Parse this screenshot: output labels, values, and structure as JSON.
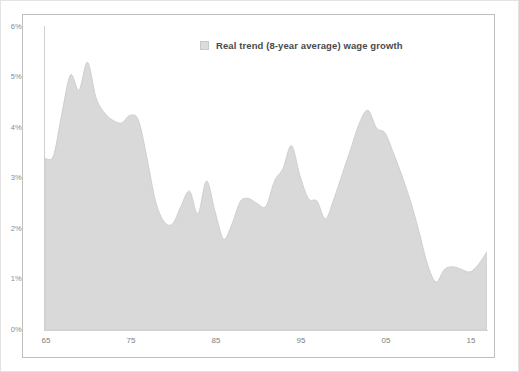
{
  "chart_data": {
    "type": "area",
    "title": "",
    "subtitle": "",
    "xlabel": "",
    "ylabel": "",
    "ylim": [
      0,
      6
    ],
    "xlim": [
      1965,
      2017
    ],
    "grid": false,
    "legend_position": "top-center",
    "y_tick_labels": [
      "6%",
      "5%",
      "4%",
      "3%",
      "2%",
      "1%",
      "0%"
    ],
    "y_tick_values": [
      6,
      5,
      4,
      3,
      2,
      1,
      0
    ],
    "x_tick_labels": [
      "65",
      "75",
      "85",
      "95",
      "05",
      "15"
    ],
    "x_tick_values": [
      1965,
      1975,
      1985,
      1995,
      2005,
      2015
    ],
    "series": [
      {
        "name": "Real trend (8-year average) wage growth",
        "color": "#d9d9d9",
        "line_color": "#cfcfcf",
        "x": [
          1965,
          1966,
          1967,
          1968,
          1969,
          1970,
          1971,
          1972,
          1973,
          1974,
          1975,
          1976,
          1977,
          1978,
          1979,
          1980,
          1981,
          1982,
          1983,
          1984,
          1985,
          1986,
          1987,
          1988,
          1989,
          1990,
          1991,
          1992,
          1993,
          1994,
          1995,
          1996,
          1997,
          1998,
          1999,
          2000,
          2001,
          2002,
          2003,
          2004,
          2005,
          2006,
          2007,
          2008,
          2009,
          2010,
          2011,
          2012,
          2013,
          2014,
          2015,
          2016,
          2017
        ],
        "values": [
          3.4,
          3.45,
          4.3,
          5.05,
          4.75,
          5.3,
          4.6,
          4.3,
          4.15,
          4.1,
          4.25,
          4.15,
          3.4,
          2.55,
          2.15,
          2.1,
          2.45,
          2.75,
          2.3,
          2.95,
          2.35,
          1.8,
          2.1,
          2.55,
          2.6,
          2.5,
          2.45,
          2.95,
          3.2,
          3.65,
          3.05,
          2.6,
          2.55,
          2.2,
          2.6,
          3.1,
          3.6,
          4.1,
          4.35,
          4.0,
          3.9,
          3.5,
          3.05,
          2.55,
          1.95,
          1.3,
          0.95,
          1.2,
          1.25,
          1.2,
          1.15,
          1.3,
          1.55
        ]
      }
    ]
  },
  "legend": {
    "label": "Real trend (8-year average) wage growth",
    "swatch_color": "#dcdcdc"
  },
  "colors": {
    "area_fill": "#d9d9d9",
    "area_stroke": "#cfcfcf",
    "axis": "#d0d0d0",
    "tick_text": "#8c8c8c",
    "border": "#bfbfbf",
    "background": "#ffffff"
  }
}
